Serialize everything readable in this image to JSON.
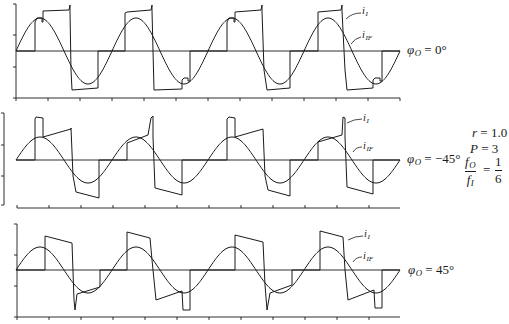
{
  "figure": {
    "panels": [
      {
        "phase_symbol": "φ",
        "phase_subscript": "O",
        "phase_value": " = 0°",
        "current_label": "i",
        "current_subscript": "I",
        "fund_label": "i",
        "fund_subscript": "IF"
      },
      {
        "phase_symbol": "φ",
        "phase_subscript": "O",
        "phase_value": " = −45°",
        "current_label": "i",
        "current_subscript": "I",
        "fund_label": "i",
        "fund_subscript": "IF"
      },
      {
        "phase_symbol": "φ",
        "phase_subscript": "O",
        "phase_value": " = 45°",
        "current_label": "i",
        "current_subscript": "I",
        "fund_label": "i",
        "fund_subscript": "IF"
      }
    ],
    "parameters": {
      "r_symbol": "r",
      "r_value": " = 1.0",
      "p_symbol": "P",
      "p_value": " = 3",
      "ratio_num": "f",
      "ratio_num_sub": "O",
      "ratio_den": "f",
      "ratio_den_sub": "I",
      "ratio_eq": "=",
      "ratio_value_num": "1",
      "ratio_value_den": "6"
    }
  },
  "chart_data": [
    {
      "type": "line",
      "title": "φO = 0°",
      "xlabel": "",
      "ylabel": "",
      "units": "relative (x: time, 32 per tick, 96 per output cycle; y: current, positive up from zero line)",
      "xlim": [
        0,
        384
      ],
      "x_tick_spacing": 32,
      "grid": false,
      "layout": {
        "x0": 16,
        "zero_y": 51,
        "left_axis": {
          "x": 16,
          "y1": 4,
          "y2": 98,
          "ticks": [
            4,
            35,
            67,
            98
          ],
          "tick_dir": -1
        },
        "bottom_axis": {
          "y": 98,
          "x1": 16,
          "x2": 400,
          "tick_dir": 1
        }
      },
      "series": [
        {
          "name": "i_IF",
          "kind": "sinusoid",
          "amplitude": 33,
          "period": 96,
          "cycles": 4,
          "phase_deg": 0
        },
        {
          "name": "i_I",
          "kind": "polyline",
          "points": [
            [
              0,
              0
            ],
            [
              19,
              0
            ],
            [
              19,
              29
            ],
            [
              21,
              33
            ],
            [
              26,
              33
            ],
            [
              26,
              29
            ],
            [
              27,
              29
            ],
            [
              27,
              40
            ],
            [
              53,
              41
            ],
            [
              54,
              46
            ],
            [
              54,
              40
            ],
            [
              55,
              -19
            ],
            [
              56,
              -39
            ],
            [
              82,
              -37
            ],
            [
              82,
              0
            ],
            [
              109,
              0
            ],
            [
              109,
              38
            ],
            [
              111,
              39
            ],
            [
              135,
              41
            ],
            [
              136,
              46
            ],
            [
              136,
              40
            ],
            [
              138,
              -39
            ],
            [
              166,
              -38
            ],
            [
              166,
              -29
            ],
            [
              168,
              -27
            ],
            [
              172,
              -27
            ],
            [
              172,
              -30
            ],
            [
              174,
              -30
            ],
            [
              174,
              0
            ],
            [
              211,
              0
            ],
            [
              211,
              29
            ],
            [
              213,
              33
            ],
            [
              218,
              33
            ],
            [
              218,
              29
            ],
            [
              219,
              29
            ],
            [
              219,
              39
            ],
            [
              245,
              41
            ],
            [
              246,
              46
            ],
            [
              246,
              40
            ],
            [
              248,
              -19
            ],
            [
              251,
              -39
            ],
            [
              274,
              -37
            ],
            [
              274,
              0
            ],
            [
              302,
              0
            ],
            [
              302,
              39
            ],
            [
              325,
              41
            ],
            [
              326,
              46
            ],
            [
              326,
              40
            ],
            [
              329,
              -19
            ],
            [
              331,
              -39
            ],
            [
              357,
              -37
            ],
            [
              357,
              -29
            ],
            [
              359,
              -27
            ],
            [
              364,
              -27
            ],
            [
              364,
              -30
            ],
            [
              366,
              -30
            ],
            [
              366,
              0
            ],
            [
              384,
              0
            ]
          ]
        }
      ]
    },
    {
      "type": "line",
      "title": "φO = −45°",
      "xlabel": "",
      "ylabel": "",
      "units": "relative (x: time, 32 per tick, 96 per output cycle; y: current, positive up from zero line)",
      "xlim": [
        0,
        384
      ],
      "x_tick_spacing": 32,
      "grid": false,
      "layout": {
        "x0": 16,
        "zero_y": 160,
        "left_axis": {
          "x": 4,
          "y1": 113,
          "y2": 205,
          "ticks": [
            113,
            145,
            176,
            205
          ],
          "tick_dir": -1
        },
        "bottom_axis": {
          "y": 208,
          "x1": 17,
          "x2": 400,
          "tick_dir": -1
        }
      },
      "series": [
        {
          "name": "i_IF",
          "kind": "sinusoid",
          "amplitude": 23,
          "period": 96,
          "cycles": 4,
          "phase_deg": 0
        },
        {
          "name": "i_I",
          "kind": "polyline",
          "points": [
            [
              0,
              0
            ],
            [
              19,
              0
            ],
            [
              19,
              41
            ],
            [
              20,
              43
            ],
            [
              27,
              42
            ],
            [
              27,
              23
            ],
            [
              55,
              31
            ],
            [
              55,
              32
            ],
            [
              57,
              -16
            ],
            [
              60,
              -32
            ],
            [
              83,
              -38
            ],
            [
              83,
              0
            ],
            [
              111,
              0
            ],
            [
              111,
              17
            ],
            [
              132,
              25
            ],
            [
              135,
              42
            ],
            [
              137,
              44
            ],
            [
              137,
              23
            ],
            [
              139,
              -28
            ],
            [
              166,
              -35
            ],
            [
              166,
              0
            ],
            [
              211,
              0
            ],
            [
              211,
              41
            ],
            [
              213,
              43
            ],
            [
              219,
              42
            ],
            [
              219,
              23
            ],
            [
              247,
              31
            ],
            [
              249,
              -16
            ],
            [
              252,
              -30
            ],
            [
              274,
              -36
            ],
            [
              274,
              0
            ],
            [
              302,
              0
            ],
            [
              302,
              18
            ],
            [
              326,
              25
            ],
            [
              327,
              43
            ],
            [
              329,
              42
            ],
            [
              329,
              23
            ],
            [
              331,
              -27
            ],
            [
              357,
              -34
            ],
            [
              357,
              0
            ],
            [
              384,
              0
            ]
          ]
        }
      ]
    },
    {
      "type": "line",
      "title": "φO = 45°",
      "xlabel": "",
      "ylabel": "",
      "units": "relative (x: time, 32 per tick, 96 per output cycle; y: current, positive up from zero line)",
      "xlim": [
        0,
        384
      ],
      "x_tick_spacing": 32,
      "grid": false,
      "layout": {
        "x0": 16,
        "zero_y": 270,
        "left_axis": {
          "x": 17,
          "y1": 224,
          "y2": 317,
          "ticks": [
            224,
            255,
            286,
            317
          ],
          "tick_dir": -1
        },
        "bottom_axis": {
          "y": 317,
          "x1": 17,
          "x2": 400,
          "tick_dir": 1
        }
      },
      "series": [
        {
          "name": "i_IF",
          "kind": "sinusoid",
          "amplitude": 23,
          "period": 96,
          "cycles": 4,
          "phase_deg": 0
        },
        {
          "name": "i_I",
          "kind": "polyline",
          "points": [
            [
              0,
              0
            ],
            [
              29,
              0
            ],
            [
              29,
              34
            ],
            [
              56,
              27
            ],
            [
              58,
              -30
            ],
            [
              59,
              -40
            ],
            [
              61,
              -24
            ],
            [
              84,
              -17
            ],
            [
              84,
              0
            ],
            [
              111,
              0
            ],
            [
              111,
              38
            ],
            [
              134,
              32
            ],
            [
              136,
              10
            ],
            [
              140,
              -30
            ],
            [
              166,
              -21
            ],
            [
              167,
              -40
            ],
            [
              174,
              -40
            ],
            [
              174,
              0
            ],
            [
              219,
              0
            ],
            [
              219,
              35
            ],
            [
              247,
              28
            ],
            [
              249,
              -15
            ],
            [
              251,
              -40
            ],
            [
              254,
              -23
            ],
            [
              276,
              -15
            ],
            [
              276,
              0
            ],
            [
              304,
              0
            ],
            [
              304,
              39
            ],
            [
              327,
              33
            ],
            [
              329,
              0
            ],
            [
              332,
              -30
            ],
            [
              358,
              -20
            ],
            [
              359,
              -38
            ],
            [
              366,
              -38
            ],
            [
              366,
              0
            ],
            [
              384,
              0
            ]
          ]
        }
      ]
    }
  ]
}
